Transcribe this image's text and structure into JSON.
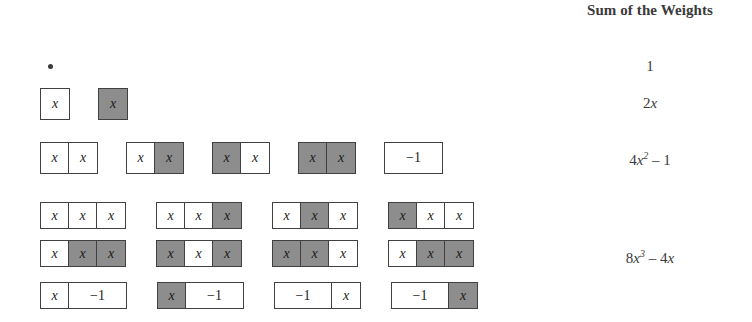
{
  "header": {
    "title": "Sum of the Weights"
  },
  "glyphs": {
    "x": "x",
    "minus_one": "−1",
    "dot": "•"
  },
  "colors": {
    "shaded_tile": "#8d8d8d",
    "unshaded_tile": "#ffffff",
    "tile_border": "#404040",
    "text": "#2b2b2b",
    "background": "#ffffff"
  },
  "rows": [
    {
      "id": "row-1",
      "tile_label": "single unit dot",
      "groups": [],
      "sum_parts": {
        "coefficient": "1",
        "variable": "",
        "exponent": "",
        "tail": ""
      },
      "sum_text": "1"
    },
    {
      "id": "row-2",
      "tile_label": "two single x tiles",
      "groups": [
        {
          "tiles": [
            {
              "label": "x",
              "shaded": false,
              "wide": false
            }
          ]
        },
        {
          "tiles": [
            {
              "label": "x",
              "shaded": true,
              "wide": false
            }
          ]
        }
      ],
      "sum_parts": {
        "coefficient": "2",
        "variable": "x",
        "exponent": "",
        "tail": ""
      },
      "sum_text": "2x"
    },
    {
      "id": "row-3",
      "tile_label": "four two-tile strips plus one minus-one tile",
      "groups": [
        {
          "tiles": [
            {
              "label": "x",
              "shaded": false,
              "wide": false
            },
            {
              "label": "x",
              "shaded": false,
              "wide": false
            }
          ]
        },
        {
          "tiles": [
            {
              "label": "x",
              "shaded": false,
              "wide": false
            },
            {
              "label": "x",
              "shaded": true,
              "wide": false
            }
          ]
        },
        {
          "tiles": [
            {
              "label": "x",
              "shaded": true,
              "wide": false
            },
            {
              "label": "x",
              "shaded": false,
              "wide": false
            }
          ]
        },
        {
          "tiles": [
            {
              "label": "x",
              "shaded": true,
              "wide": false
            },
            {
              "label": "x",
              "shaded": true,
              "wide": false
            }
          ]
        },
        {
          "tiles": [
            {
              "label": "−1",
              "shaded": false,
              "wide": true
            }
          ]
        }
      ],
      "sum_parts": {
        "coefficient": "4",
        "variable": "x",
        "exponent": "2",
        "tail": " – 1"
      },
      "sum_text": "4x2 – 1"
    },
    {
      "id": "row-4",
      "tile_label": "four three-tile strips, first set",
      "groups": [
        {
          "tiles": [
            {
              "label": "x",
              "shaded": false,
              "wide": false
            },
            {
              "label": "x",
              "shaded": false,
              "wide": false
            },
            {
              "label": "x",
              "shaded": false,
              "wide": false
            }
          ]
        },
        {
          "tiles": [
            {
              "label": "x",
              "shaded": false,
              "wide": false
            },
            {
              "label": "x",
              "shaded": false,
              "wide": false
            },
            {
              "label": "x",
              "shaded": true,
              "wide": false
            }
          ]
        },
        {
          "tiles": [
            {
              "label": "x",
              "shaded": false,
              "wide": false
            },
            {
              "label": "x",
              "shaded": true,
              "wide": false
            },
            {
              "label": "x",
              "shaded": false,
              "wide": false
            }
          ]
        },
        {
          "tiles": [
            {
              "label": "x",
              "shaded": true,
              "wide": false
            },
            {
              "label": "x",
              "shaded": false,
              "wide": false
            },
            {
              "label": "x",
              "shaded": false,
              "wide": false
            }
          ]
        }
      ],
      "sum_parts": null,
      "sum_text": ""
    },
    {
      "id": "row-5",
      "tile_label": "four three-tile strips, second set",
      "groups": [
        {
          "tiles": [
            {
              "label": "x",
              "shaded": false,
              "wide": false
            },
            {
              "label": "x",
              "shaded": true,
              "wide": false
            },
            {
              "label": "x",
              "shaded": true,
              "wide": false
            }
          ]
        },
        {
          "tiles": [
            {
              "label": "x",
              "shaded": true,
              "wide": false
            },
            {
              "label": "x",
              "shaded": false,
              "wide": false
            },
            {
              "label": "x",
              "shaded": true,
              "wide": false
            }
          ]
        },
        {
          "tiles": [
            {
              "label": "x",
              "shaded": true,
              "wide": false
            },
            {
              "label": "x",
              "shaded": true,
              "wide": false
            },
            {
              "label": "x",
              "shaded": false,
              "wide": false
            }
          ]
        },
        {
          "tiles": [
            {
              "label": "x",
              "shaded": false,
              "wide": false
            },
            {
              "label": "x",
              "shaded": true,
              "wide": false
            },
            {
              "label": "x",
              "shaded": true,
              "wide": false
            }
          ]
        }
      ],
      "sum_parts": {
        "coefficient": "8",
        "variable": "x",
        "exponent": "3",
        "tail": " – 4x"
      },
      "sum_text": "8x3 – 4x"
    },
    {
      "id": "row-6",
      "tile_label": "four strips pairing an x tile with a minus-one tile",
      "groups": [
        {
          "tiles": [
            {
              "label": "x",
              "shaded": false,
              "wide": false
            },
            {
              "label": "−1",
              "shaded": false,
              "wide": true
            }
          ]
        },
        {
          "tiles": [
            {
              "label": "x",
              "shaded": true,
              "wide": false
            },
            {
              "label": "−1",
              "shaded": false,
              "wide": true
            }
          ]
        },
        {
          "tiles": [
            {
              "label": "−1",
              "shaded": false,
              "wide": true
            },
            {
              "label": "x",
              "shaded": false,
              "wide": false
            }
          ]
        },
        {
          "tiles": [
            {
              "label": "−1",
              "shaded": false,
              "wide": true
            },
            {
              "label": "x",
              "shaded": true,
              "wide": false
            }
          ]
        }
      ],
      "sum_parts": null,
      "sum_text": ""
    }
  ]
}
